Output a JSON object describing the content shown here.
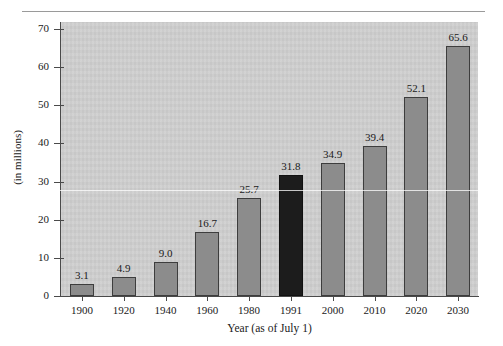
{
  "chart_data": {
    "type": "bar",
    "title": "",
    "xlabel": "Year (as of July 1)",
    "ylabel": "(in millions)",
    "categories": [
      "1900",
      "1920",
      "1940",
      "1960",
      "1980",
      "1991",
      "2000",
      "2010",
      "2020",
      "2030"
    ],
    "values": [
      3.1,
      4.9,
      9.0,
      16.7,
      25.7,
      31.8,
      34.9,
      39.4,
      52.1,
      65.6
    ],
    "value_labels": [
      "3.1",
      "4.9",
      "9.0",
      "16.7",
      "25.7",
      "31.8",
      "34.9",
      "39.4",
      "52.1",
      "65.6"
    ],
    "ylim": [
      0,
      70
    ],
    "y_ticks": [
      0,
      10,
      20,
      30,
      40,
      50,
      60,
      70
    ],
    "y_tick_labels": [
      "0",
      "10",
      "20",
      "30",
      "40",
      "50",
      "60",
      "70"
    ],
    "grid": false,
    "legend": "none",
    "highlighted_category": "1991",
    "colors": {
      "bar": "#8c8c8c",
      "bar_highlight": "#1c1c1c",
      "bar_outline": "#3d3d3d",
      "plot_background": "#cfcfcf",
      "page_background": "#ffffff",
      "axis": "#4a4a4a",
      "text": "#1a1a1a",
      "rule": "#9a9a9a"
    }
  }
}
